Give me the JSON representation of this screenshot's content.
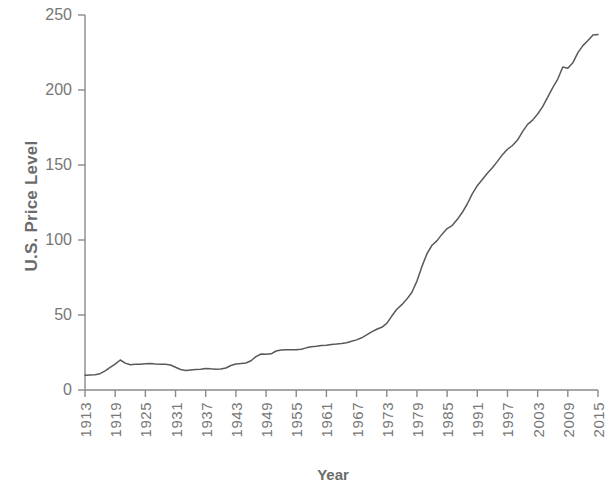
{
  "chart_data": {
    "type": "line",
    "title": "",
    "xlabel": "Year",
    "ylabel": "U.S. Price Level",
    "xlim": [
      1913,
      2015
    ],
    "ylim": [
      0,
      250
    ],
    "yticks": [
      0,
      50,
      100,
      150,
      200,
      250
    ],
    "xticks": [
      1913,
      1919,
      1925,
      1931,
      1937,
      1943,
      1949,
      1955,
      1961,
      1967,
      1973,
      1979,
      1985,
      1991,
      1997,
      2003,
      2009,
      2015
    ],
    "grid": false,
    "legend": null,
    "line_color": "#595959",
    "axis_color": "#8a8a8a",
    "text_color": "#777777",
    "series": [
      {
        "name": "U.S. Price Level",
        "x": [
          1913,
          1914,
          1915,
          1916,
          1917,
          1918,
          1919,
          1920,
          1921,
          1922,
          1923,
          1924,
          1925,
          1926,
          1927,
          1928,
          1929,
          1930,
          1931,
          1932,
          1933,
          1934,
          1935,
          1936,
          1937,
          1938,
          1939,
          1940,
          1941,
          1942,
          1943,
          1944,
          1945,
          1946,
          1947,
          1948,
          1949,
          1950,
          1951,
          1952,
          1953,
          1954,
          1955,
          1956,
          1957,
          1958,
          1959,
          1960,
          1961,
          1962,
          1963,
          1964,
          1965,
          1966,
          1967,
          1968,
          1969,
          1970,
          1971,
          1972,
          1973,
          1974,
          1975,
          1976,
          1977,
          1978,
          1979,
          1980,
          1981,
          1982,
          1983,
          1984,
          1985,
          1986,
          1987,
          1988,
          1989,
          1990,
          1991,
          1992,
          1993,
          1994,
          1995,
          1996,
          1997,
          1998,
          1999,
          2000,
          2001,
          2002,
          2003,
          2004,
          2005,
          2006,
          2007,
          2008,
          2009,
          2010,
          2011,
          2012,
          2013,
          2014,
          2015
        ],
        "values": [
          9.9,
          10.0,
          10.1,
          10.9,
          12.8,
          15.1,
          17.3,
          20.0,
          17.9,
          16.8,
          17.1,
          17.1,
          17.5,
          17.7,
          17.4,
          17.2,
          17.2,
          16.7,
          15.2,
          13.7,
          13.0,
          13.4,
          13.7,
          13.9,
          14.4,
          14.1,
          13.9,
          14.0,
          14.7,
          16.3,
          17.3,
          17.6,
          18.0,
          19.5,
          22.3,
          24.0,
          23.8,
          24.1,
          26.0,
          26.6,
          26.8,
          26.9,
          26.8,
          27.2,
          28.1,
          28.9,
          29.2,
          29.6,
          29.9,
          30.3,
          30.6,
          31.0,
          31.5,
          32.5,
          33.4,
          34.8,
          36.7,
          38.8,
          40.5,
          41.8,
          44.4,
          49.3,
          53.8,
          56.9,
          60.6,
          65.2,
          72.6,
          82.4,
          90.9,
          96.5,
          99.6,
          103.9,
          107.6,
          109.6,
          113.6,
          118.3,
          124.0,
          130.7,
          136.2,
          140.3,
          144.5,
          148.2,
          152.4,
          156.9,
          160.5,
          163.0,
          166.6,
          172.2,
          177.1,
          179.9,
          184.0,
          188.9,
          195.3,
          201.6,
          207.3,
          215.3,
          214.5,
          218.1,
          224.9,
          229.6,
          233.0,
          236.7,
          237.0
        ]
      }
    ]
  },
  "axis": {
    "ytick_labels": [
      "250",
      "200",
      "150",
      "100",
      "50",
      "0"
    ],
    "xtick_labels": [
      "1913",
      "1919",
      "1925",
      "1931",
      "1937",
      "1943",
      "1949",
      "1955",
      "1961",
      "1967",
      "1973",
      "1979",
      "1985",
      "1991",
      "1997",
      "2003",
      "2009",
      "2015"
    ],
    "ylabel_text": "U.S. Price Level",
    "xlabel_text": "Year"
  }
}
